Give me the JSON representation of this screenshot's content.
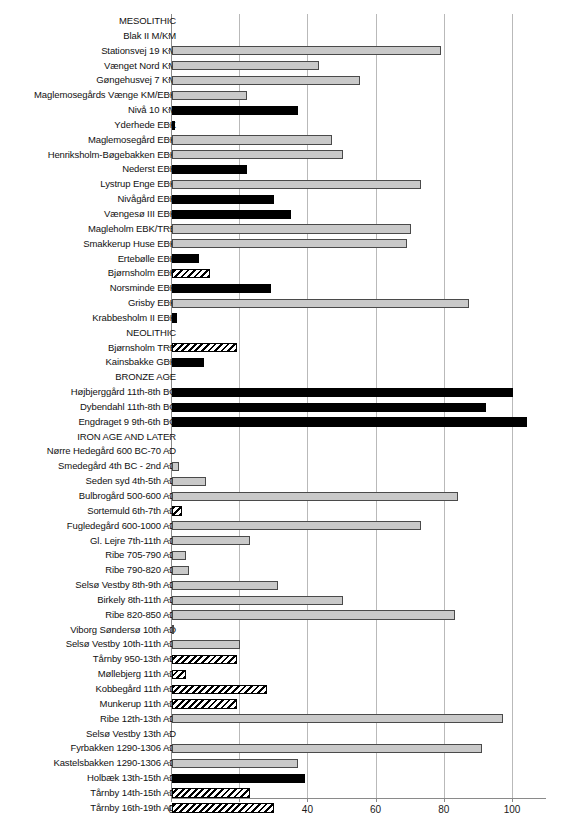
{
  "chart_data": {
    "type": "bar",
    "orientation": "horizontal",
    "title": "",
    "xlabel": "",
    "ylabel": "",
    "xlim": [
      0,
      110
    ],
    "xticks": [
      0,
      20,
      40,
      60,
      80,
      100
    ],
    "xtick_labels": [
      "0",
      "20",
      "40",
      "60",
      "80",
      "100"
    ],
    "grid": true,
    "legend": "none",
    "fill_styles": {
      "grey": "#c9c9c9",
      "black": "#000000",
      "hatch": "white with black diagonal hatching"
    },
    "categories": [
      "MESOLITHIC",
      "Blak II M/KM",
      "Stationsvej 19 KM",
      "Vænget Nord KM",
      "Gøngehusvej 7 KM",
      "Maglemosegårds Vænge KM/EBK",
      "Nivå 10 KM",
      "Yderhede EBK",
      "Maglemosegård EBK",
      "Henriksholm-Bøgebakken EBK",
      "Nederst EBK",
      "Lystrup Enge EBK",
      "Nivågård EBK",
      "Vængesø III EBK",
      "Magleholm EBK/TRB",
      "Smakkerup Huse EBK",
      "Ertebølle EBK",
      "Bjørnsholm EBK",
      "Norsminde EBK",
      "Grisby EBK",
      "Krabbesholm II EBK",
      "NEOLITHIC",
      "Bjørnsholm TRB",
      "Kainsbakke GBK",
      "BRONZE AGE",
      "Højbjerggård 11th-8th BC",
      "Dybendahl 11th-8th BC",
      "Engdraget 9 9th-6th BC",
      "IRON AGE AND LATER",
      "Nørre Hedegård 600 BC-70 AD",
      "Smedegård 4th BC - 2nd AD",
      "Seden syd 4th-5th AD",
      "Bulbrogård 500-600 AD",
      "Sortemuld 6th-7th AD",
      "Fugledegård 600-1000 AD",
      "Gl. Lejre 7th-11th AD",
      "Ribe 705-790 AD",
      "Ribe 790-820 AD",
      "Selsø Vestby 8th-9th AD",
      "Birkely 8th-11th AD",
      "Ribe 820-850 AD",
      "Viborg Søndersø 10th AD",
      "Selsø Vestby 10th-11th AD",
      "Tårnby 950-13th AD",
      "Møllebjerg 11th AD",
      "Kobbegård 11th AD",
      "Munkerup 11th AD",
      "Ribe 12th-13th AD",
      "Selsø Vestby 13th AD",
      "Fyrbakken 1290-1306 AD",
      "Kastelsbakken 1290-1306 AD",
      "Holbæk 13th-15th AD",
      "Tårnby 14th-15th AD",
      "Tårnby 16th-19th AD"
    ],
    "values": [
      null,
      0,
      79,
      43,
      55,
      22,
      37,
      1,
      47,
      50,
      22,
      73,
      30,
      35,
      70,
      69,
      8,
      11,
      29,
      87,
      1.5,
      null,
      19,
      9.5,
      null,
      100,
      92,
      104,
      null,
      0,
      2,
      10,
      84,
      3,
      73,
      23,
      4,
      5,
      31,
      50,
      83,
      0.5,
      20,
      19,
      4,
      28,
      19,
      97,
      0,
      91,
      37,
      39,
      23,
      30
    ],
    "styles": [
      "section",
      "zero",
      "grey",
      "grey",
      "grey",
      "grey",
      "black",
      "black",
      "grey",
      "grey",
      "black",
      "grey",
      "black",
      "black",
      "grey",
      "grey",
      "black",
      "hatch",
      "black",
      "grey",
      "black",
      "section",
      "hatch",
      "black",
      "section",
      "black",
      "black",
      "black",
      "section",
      "zero",
      "grey",
      "grey",
      "grey",
      "hatch",
      "grey",
      "grey",
      "grey",
      "grey",
      "grey",
      "grey",
      "grey",
      "grey",
      "grey",
      "hatch",
      "hatch",
      "hatch",
      "hatch",
      "grey",
      "zero",
      "grey",
      "grey",
      "black",
      "hatch",
      "hatch"
    ]
  }
}
